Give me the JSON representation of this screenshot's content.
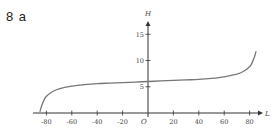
{
  "question": {
    "number": "8",
    "part": "a"
  },
  "chart_data": {
    "type": "line",
    "title": "",
    "xlabel": "L",
    "ylabel": "H",
    "origin_label": "O",
    "xlim": [
      -90,
      85
    ],
    "ylim": [
      0,
      18
    ],
    "x_ticks": [
      -80,
      -60,
      -40,
      -20,
      20,
      40,
      60,
      80
    ],
    "x_tick_labels": [
      "-80",
      "-60",
      "-40",
      "-20",
      "20",
      "40",
      "60",
      "80"
    ],
    "y_ticks": [
      5,
      10,
      15
    ],
    "y_tick_labels": [
      "5",
      "10",
      "15"
    ],
    "grid": false,
    "legend": null,
    "series": [
      {
        "name": "H",
        "x": [
          -85,
          -84,
          -82,
          -80,
          -75,
          -70,
          -60,
          -50,
          -40,
          -30,
          -20,
          -10,
          0,
          10,
          20,
          30,
          40,
          50,
          60,
          70,
          75,
          80,
          82,
          84,
          85
        ],
        "values": [
          0.3,
          1.2,
          2.4,
          3.2,
          4.1,
          4.6,
          5.1,
          5.4,
          5.6,
          5.7,
          5.8,
          5.9,
          6.0,
          6.1,
          6.2,
          6.3,
          6.4,
          6.6,
          6.9,
          7.4,
          7.9,
          8.8,
          9.6,
          10.8,
          11.7
        ]
      }
    ],
    "colors": {
      "curve": "#777777",
      "axis": "#333333",
      "text": "#444444"
    }
  }
}
